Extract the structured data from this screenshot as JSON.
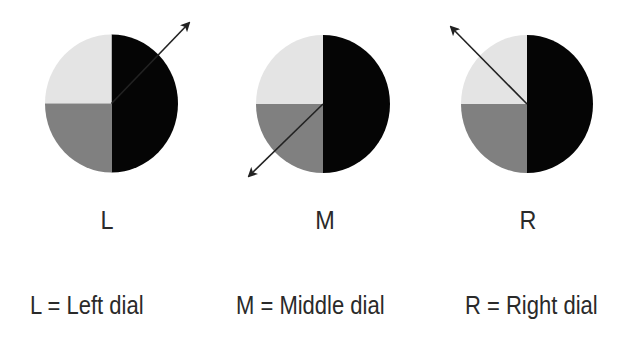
{
  "colors": {
    "background": "#ffffff",
    "black_half": "#050505",
    "light_quadrant": "#e4e4e4",
    "dark_quadrant": "#808080",
    "arrow": "#222222",
    "text": "#2a2a2a"
  },
  "dials": [
    {
      "id": "L",
      "letter": "L",
      "center": [
        111.5,
        103.5
      ],
      "radius": [
        66.5,
        69
      ],
      "arrow_tip": [
        189,
        23
      ],
      "arrow_direction": "up-right"
    },
    {
      "id": "M",
      "letter": "M",
      "center": [
        323,
        104
      ],
      "radius": [
        67,
        69
      ],
      "arrow_tip": [
        249,
        176
      ],
      "arrow_direction": "down-left"
    },
    {
      "id": "R",
      "letter": "R",
      "center": [
        527,
        104
      ],
      "radius": [
        66,
        69
      ],
      "arrow_tip": [
        451,
        27
      ],
      "arrow_direction": "up-left"
    }
  ],
  "legend": [
    {
      "text": "L = Left dial"
    },
    {
      "text": "M = Middle dial"
    },
    {
      "text": "R = Right dial"
    }
  ]
}
